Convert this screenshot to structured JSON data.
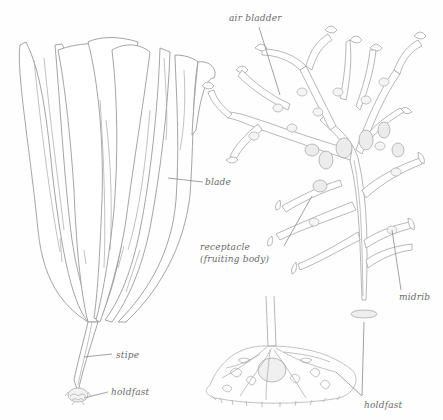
{
  "figure": {
    "background": "#fefefe",
    "line_color": "#9a9a9a",
    "label_color": "#6a6a6a"
  },
  "labels": {
    "air_bladder": "air bladder",
    "blade": "blade",
    "receptacle_line1": "receptacle",
    "receptacle_line2": "(fruiting body)",
    "midrib": "midrib",
    "stipe": "stipe",
    "holdfast_left": "holdfast",
    "holdfast_right": "holdfast"
  }
}
